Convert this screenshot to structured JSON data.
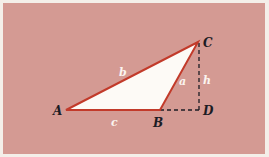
{
  "diagram": {
    "colors": {
      "background": "#d49a93",
      "border": "#f4efe9",
      "triangle_fill": "#fdfaf6",
      "triangle_stroke": "#c23a2a",
      "dashed": "#1c1c24",
      "vertex_label": "#1c1c24",
      "side_label": "#fbf4ef"
    },
    "vertices": {
      "A": {
        "label": "A",
        "x": 66,
        "y": 110
      },
      "B": {
        "label": "B",
        "x": 160,
        "y": 110
      },
      "C": {
        "label": "C",
        "x": 198,
        "y": 42
      },
      "D": {
        "label": "D",
        "x": 199,
        "y": 110
      }
    },
    "sides": {
      "a": "a",
      "b": "b",
      "c": "c",
      "h": "h"
    }
  }
}
